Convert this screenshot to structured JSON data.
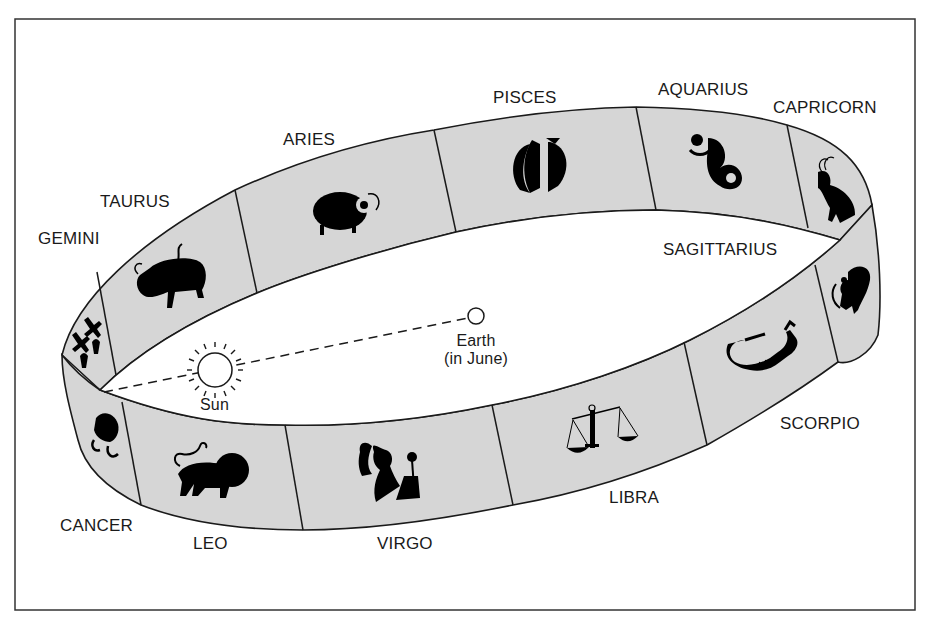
{
  "diagram": {
    "colors": {
      "band_fill": "#d6d6d6",
      "stroke": "#1a1a1a",
      "background": "#ffffff",
      "symbol": "#000000"
    },
    "signs": [
      {
        "name": "GEMINI",
        "label_pos": [
          38,
          243
        ],
        "symbol": "twins-icon"
      },
      {
        "name": "TAURUS",
        "label_pos": [
          100,
          200
        ],
        "symbol": "bull-icon"
      },
      {
        "name": "ARIES",
        "label_pos": [
          283,
          140
        ],
        "symbol": "ram-icon"
      },
      {
        "name": "PISCES",
        "label_pos": [
          493,
          96
        ],
        "symbol": "fish-icon"
      },
      {
        "name": "AQUARIUS",
        "label_pos": [
          658,
          90
        ],
        "symbol": "water-bearer-icon"
      },
      {
        "name": "CAPRICORN",
        "label_pos": [
          773,
          108
        ],
        "symbol": "goat-icon"
      },
      {
        "name": "SAGITTARIUS",
        "label_pos": [
          663,
          250
        ],
        "symbol": "archer-icon"
      },
      {
        "name": "SCORPIO",
        "label_pos": [
          780,
          425
        ],
        "symbol": "scorpion-icon"
      },
      {
        "name": "LIBRA",
        "label_pos": [
          609,
          499
        ],
        "symbol": "scales-icon"
      },
      {
        "name": "VIRGO",
        "label_pos": [
          377,
          546
        ],
        "symbol": "maiden-icon"
      },
      {
        "name": "LEO",
        "label_pos": [
          193,
          546
        ],
        "symbol": "lion-icon"
      },
      {
        "name": "CANCER",
        "label_pos": [
          60,
          527
        ],
        "symbol": "crab-icon"
      }
    ],
    "sun": {
      "label": "Sun"
    },
    "earth": {
      "label_line1": "Earth",
      "label_line2": "(in June)"
    }
  }
}
